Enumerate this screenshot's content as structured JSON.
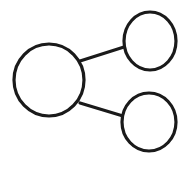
{
  "diagram": {
    "type": "node-link",
    "stroke_color": "#1a1a1a",
    "background": "#ffffff",
    "nodes": [
      {
        "id": "root",
        "cx": 49,
        "cy": 80,
        "rx": 35,
        "ry": 36
      },
      {
        "id": "child-top",
        "cx": 150,
        "cy": 41,
        "rx": 26,
        "ry": 29
      },
      {
        "id": "child-bottom",
        "cx": 149,
        "cy": 122,
        "rx": 27,
        "ry": 29
      }
    ],
    "edges": [
      {
        "from": "root",
        "to": "child-top",
        "x1": 80,
        "y1": 61,
        "x2": 124,
        "y2": 47
      },
      {
        "from": "root",
        "to": "child-bottom",
        "x1": 80,
        "y1": 103,
        "x2": 123,
        "y2": 116
      }
    ]
  }
}
